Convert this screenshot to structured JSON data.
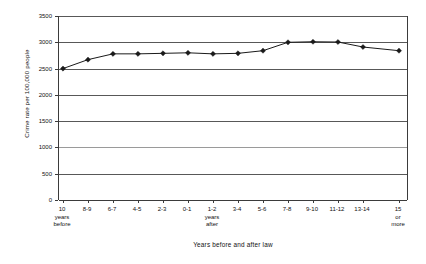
{
  "chart_data": {
    "type": "line",
    "title": "",
    "xlabel": "Years before and after law",
    "ylabel": "Crime rate per 100,000 people",
    "ylim": [
      0,
      3500
    ],
    "yticks": [
      0,
      500,
      1000,
      1500,
      2000,
      2500,
      3000,
      3500
    ],
    "ytick_labels": [
      "0",
      "500",
      "1000",
      "1500",
      "2000",
      "2500",
      "3000",
      "3500"
    ],
    "grid": true,
    "legend": "none",
    "categories": [
      "10 years before",
      "8-9",
      "6-7",
      "4-5",
      "2-3",
      "0-1",
      "1-2 years after",
      "3-4",
      "5-6",
      "7-8",
      "9-10",
      "11-12",
      "13-14",
      "15 or more"
    ],
    "xtick_labels": [
      {
        "line1": "10",
        "line2": "years",
        "line3": "before"
      },
      {
        "line1": "8-9",
        "line2": "",
        "line3": ""
      },
      {
        "line1": "6-7",
        "line2": "",
        "line3": ""
      },
      {
        "line1": "4-5",
        "line2": "",
        "line3": ""
      },
      {
        "line1": "2-3",
        "line2": "",
        "line3": ""
      },
      {
        "line1": "0-1",
        "line2": "",
        "line3": ""
      },
      {
        "line1": "1-2",
        "line2": "years",
        "line3": "after"
      },
      {
        "line1": "3-4",
        "line2": "",
        "line3": ""
      },
      {
        "line1": "5-6",
        "line2": "",
        "line3": ""
      },
      {
        "line1": "7-8",
        "line2": "",
        "line3": ""
      },
      {
        "line1": "9-10",
        "line2": "",
        "line3": ""
      },
      {
        "line1": "11-12",
        "line2": "",
        "line3": ""
      },
      {
        "line1": "13-14",
        "line2": "",
        "line3": ""
      },
      {
        "line1": "15",
        "line2": "or",
        "line3": "more"
      }
    ],
    "series": [
      {
        "name": "Crime rate",
        "values": [
          2500,
          2670,
          2780,
          2780,
          2790,
          2800,
          2780,
          2790,
          2840,
          3000,
          3010,
          3005,
          2910,
          2840
        ],
        "marker": "diamond",
        "color": "#1a1a1a"
      }
    ],
    "x_positions": [
      4,
      29,
      54,
      79,
      104,
      129,
      154,
      179,
      204,
      229,
      254,
      279,
      304,
      340
    ],
    "series_points_x": [
      4,
      29,
      54,
      79,
      104,
      129,
      154,
      179,
      204,
      229,
      254,
      279,
      304,
      340
    ]
  },
  "colors": {
    "series": "#1a1a1a",
    "grid": "#585858",
    "axis": "#3b3b3b",
    "background": "#ffffff"
  }
}
